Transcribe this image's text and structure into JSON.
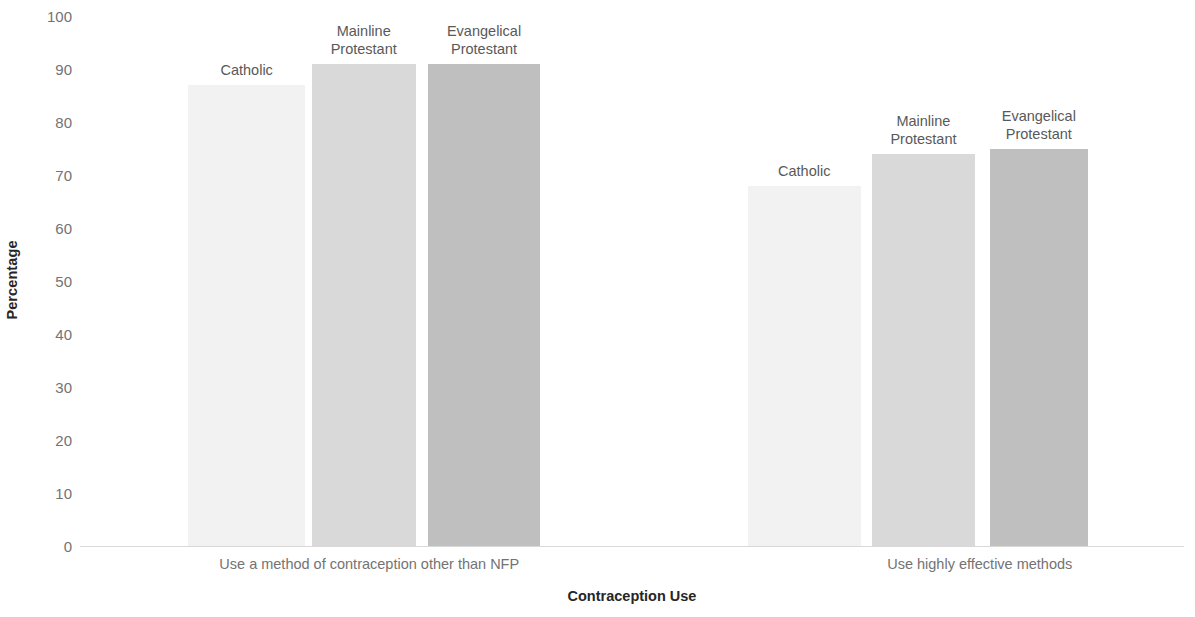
{
  "chart_data": {
    "type": "bar",
    "title": "",
    "xlabel": "Contraception Use",
    "ylabel": "Percentage",
    "ylim": [
      0,
      100
    ],
    "ytick_step": 10,
    "yticks": [
      100,
      90,
      80,
      70,
      60,
      50,
      40,
      30,
      20,
      10,
      0
    ],
    "ytick_labels": [
      "100",
      "90",
      "80",
      "70",
      "60",
      "50",
      "40",
      "30",
      "20",
      "10",
      "0"
    ],
    "grid": false,
    "legend": "none (series labeled above bars)",
    "categories": [
      "Use a method of contraception other than NFP",
      "Use highly effective methods"
    ],
    "series": [
      {
        "name": "Catholic",
        "values": [
          87,
          68
        ],
        "color": "#f2f2f2"
      },
      {
        "name": "Mainline Protestant",
        "values": [
          91,
          74
        ],
        "color": "#d9d9d9"
      },
      {
        "name": "Evangelical Protestant",
        "values": [
          91,
          75
        ],
        "color": "#bfbfbf"
      }
    ],
    "bars": [
      {
        "group": 0,
        "series": "Catholic",
        "label": "Catholic",
        "value": 87,
        "color": "#f2f2f2",
        "x_pct": 9.8,
        "w_pct": 10.6
      },
      {
        "group": 0,
        "series": "Mainline Protestant",
        "label": "Mainline\nProtestant",
        "value": 91,
        "color": "#d9d9d9",
        "x_pct": 21.0,
        "w_pct": 9.4
      },
      {
        "group": 0,
        "series": "Evangelical Protestant",
        "label": "Evangelical\nProtestant",
        "value": 91,
        "color": "#bfbfbf",
        "x_pct": 31.5,
        "w_pct": 10.2
      },
      {
        "group": 1,
        "series": "Catholic",
        "label": "Catholic",
        "value": 68,
        "color": "#f2f2f2",
        "x_pct": 60.5,
        "w_pct": 10.2
      },
      {
        "group": 1,
        "series": "Mainline Protestant",
        "label": "Mainline\nProtestant",
        "value": 74,
        "color": "#d9d9d9",
        "x_pct": 71.7,
        "w_pct": 9.4
      },
      {
        "group": 1,
        "series": "Evangelical Protestant",
        "label": "Evangelical\nProtestant",
        "value": 75,
        "color": "#bfbfbf",
        "x_pct": 82.4,
        "w_pct": 8.9
      }
    ],
    "category_positions_pct": [
      26.2,
      81.5
    ],
    "axis_color": "#d9d9d9",
    "tick_text_color": "#737373",
    "title_text_color": "#262626"
  }
}
